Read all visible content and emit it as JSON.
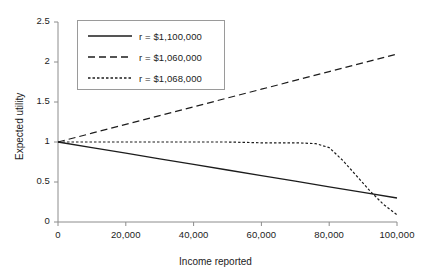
{
  "chart_data": {
    "type": "line",
    "title": "",
    "xlabel": "Income reported",
    "ylabel": "Expected utility",
    "xlim": [
      0,
      100000
    ],
    "ylim": [
      0,
      2.5
    ],
    "xticks": [
      0,
      20000,
      40000,
      60000,
      80000,
      100000
    ],
    "xtick_labels": [
      "0",
      "20,000",
      "40,000",
      "60,000",
      "80,000",
      "100,000"
    ],
    "yticks": [
      0,
      0.5,
      1,
      1.5,
      2,
      2.5
    ],
    "ytick_labels": [
      "0",
      "0.5",
      "1",
      "1.5",
      "2",
      "2.5"
    ],
    "grid": false,
    "legend_position": "upper-left-inside",
    "line_color": "#1c1c1c",
    "series": [
      {
        "name": "r = $1,100,000",
        "style": "solid",
        "x": [
          0,
          10000,
          20000,
          30000,
          40000,
          50000,
          60000,
          70000,
          80000,
          90000,
          100000
        ],
        "values": [
          1.0,
          0.93,
          0.86,
          0.79,
          0.72,
          0.65,
          0.58,
          0.51,
          0.44,
          0.37,
          0.3
        ]
      },
      {
        "name": "r = $1,060,000",
        "style": "dashed",
        "x": [
          0,
          10000,
          20000,
          30000,
          40000,
          50000,
          60000,
          70000,
          80000,
          90000,
          100000
        ],
        "values": [
          1.0,
          1.11,
          1.22,
          1.33,
          1.44,
          1.55,
          1.66,
          1.77,
          1.88,
          1.99,
          2.1
        ]
      },
      {
        "name": "r = $1,068,000",
        "style": "dotted",
        "x": [
          0,
          10000,
          20000,
          30000,
          40000,
          50000,
          60000,
          70000,
          76000,
          80000,
          84000,
          88000,
          92000,
          96000,
          100000
        ],
        "values": [
          1.0,
          1.0,
          1.0,
          1.0,
          1.0,
          1.0,
          0.99,
          0.99,
          0.98,
          0.93,
          0.77,
          0.58,
          0.39,
          0.22,
          0.09
        ]
      }
    ]
  },
  "legend": {
    "items": [
      {
        "label": "r = $1,100,000",
        "style": "solid"
      },
      {
        "label": "r = $1,060,000",
        "style": "dashed"
      },
      {
        "label": "r = $1,068,000",
        "style": "dotted"
      }
    ]
  }
}
